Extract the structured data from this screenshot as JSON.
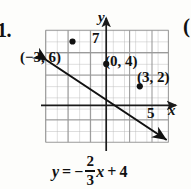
{
  "problem": {
    "number": "1."
  },
  "next_problem": {
    "partial_paren": "("
  },
  "graph": {
    "axis_labels": {
      "y": "y",
      "x": "x"
    },
    "tick_labels": {
      "y_intercept_top": "7",
      "x_axis": "5"
    },
    "grid": {
      "columns": 11,
      "rows": 10,
      "cell_px": 11.2,
      "show": true,
      "minor_color": "#b9b9b9",
      "major_color": "#7a7a7a"
    },
    "axes": {
      "origin_x_px": 61,
      "origin_y_px": 76,
      "color": "#1a1a1a"
    },
    "points": [
      {
        "label": "(−3, 6)",
        "x": -3,
        "y": 6
      },
      {
        "label": "(0, 4)",
        "x": 0,
        "y": 4
      },
      {
        "label": "(3, 2)",
        "x": 3,
        "y": 2
      }
    ],
    "line": {
      "color": "#111111",
      "slope": -0.6666666667,
      "intercept": 4,
      "arrow_start": true,
      "arrow_end": true
    }
  },
  "equation": {
    "lhs": "y",
    "equals": "=",
    "sign": "−",
    "numerator": "2",
    "denominator": "3",
    "variable": "x",
    "plus": "+",
    "constant": "4",
    "full_text": "y = -2/3 x + 4"
  },
  "colors": {
    "ink": "#111111",
    "grid_light": "#b9b9b9",
    "grid_dark": "#7a7a7a",
    "page": "#fdfdfb"
  }
}
